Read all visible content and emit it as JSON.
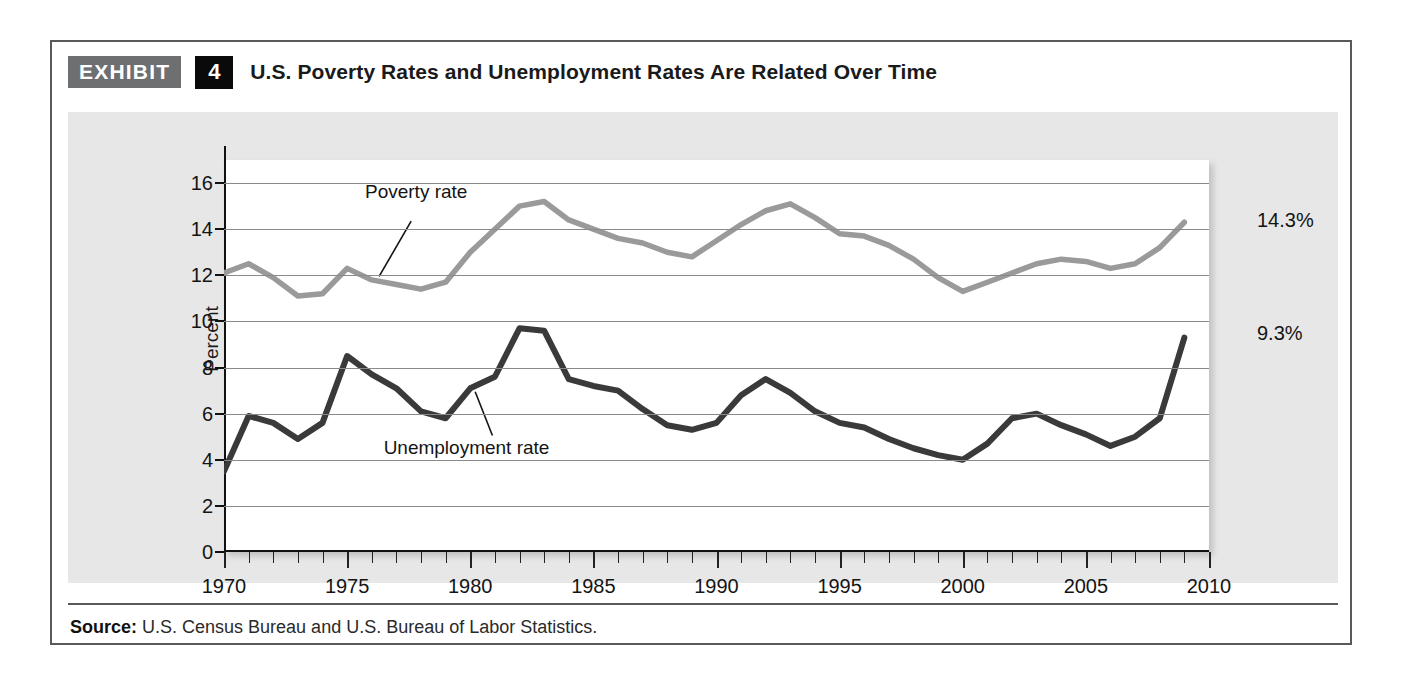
{
  "exhibit": {
    "badge_label": "EXHIBIT",
    "number": "4",
    "title": "U.S. Poverty Rates and Unemployment Rates Are Related Over Time"
  },
  "source": {
    "prefix": "Source:",
    "text": " U.S. Census Bureau and U.S. Bureau of Labor Statistics."
  },
  "annotations": {
    "poverty_label": "Poverty rate",
    "unemployment_label": "Unemployment  rate",
    "poverty_end": "14.3%",
    "unemployment_end": "9.3%"
  },
  "colors": {
    "poverty_line": "#9a9a9a",
    "unemployment_line": "#3a3a3a",
    "panel_bg": "#e6e7e6",
    "badge_gray": "#6e6f71",
    "badge_black": "#0a0a0a",
    "frame": "#58595b",
    "gridline": "#8a8a8a"
  },
  "chart_data": {
    "type": "line",
    "title": "U.S. Poverty Rates and Unemployment Rates Are Related Over Time",
    "xlabel": "",
    "ylabel": "Percent",
    "ylim": [
      0,
      17
    ],
    "xlim": [
      1970,
      2010
    ],
    "yticks": [
      0,
      2,
      4,
      6,
      8,
      10,
      12,
      14,
      16
    ],
    "xticks": [
      1970,
      1975,
      1980,
      1985,
      1990,
      1995,
      2000,
      2005,
      2010
    ],
    "grid": "horizontal",
    "legend": "inline-annotations",
    "x": [
      1970,
      1971,
      1972,
      1973,
      1974,
      1975,
      1976,
      1977,
      1978,
      1979,
      1980,
      1981,
      1982,
      1983,
      1984,
      1985,
      1986,
      1987,
      1988,
      1989,
      1990,
      1991,
      1992,
      1993,
      1994,
      1995,
      1996,
      1997,
      1998,
      1999,
      2000,
      2001,
      2002,
      2003,
      2004,
      2005,
      2006,
      2007,
      2008,
      2009
    ],
    "series": [
      {
        "name": "Poverty rate",
        "color": "#9a9a9a",
        "values": [
          12.1,
          12.5,
          11.9,
          11.1,
          11.2,
          12.3,
          11.8,
          11.6,
          11.4,
          11.7,
          13.0,
          14.0,
          15.0,
          15.2,
          14.4,
          14.0,
          13.6,
          13.4,
          13.0,
          12.8,
          13.5,
          14.2,
          14.8,
          15.1,
          14.5,
          13.8,
          13.7,
          13.3,
          12.7,
          11.9,
          11.3,
          11.7,
          12.1,
          12.5,
          12.7,
          12.6,
          12.3,
          12.5,
          13.2,
          14.3
        ],
        "end_label": "14.3%"
      },
      {
        "name": "Unemployment rate",
        "color": "#3a3a3a",
        "values": [
          3.5,
          5.9,
          5.6,
          4.9,
          5.6,
          8.5,
          7.7,
          7.1,
          6.1,
          5.8,
          7.1,
          7.6,
          9.7,
          9.6,
          7.5,
          7.2,
          7.0,
          6.2,
          5.5,
          5.3,
          5.6,
          6.8,
          7.5,
          6.9,
          6.1,
          5.6,
          5.4,
          4.9,
          4.5,
          4.2,
          4.0,
          4.7,
          5.8,
          6.0,
          5.5,
          5.1,
          4.6,
          5.0,
          5.8,
          9.3
        ],
        "end_label": "9.3%"
      }
    ]
  }
}
